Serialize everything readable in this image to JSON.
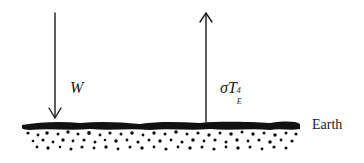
{
  "diagram": {
    "title": "",
    "arrows": [
      {
        "id": "incoming",
        "direction": "down",
        "label": "W"
      },
      {
        "id": "outgoing",
        "direction": "up",
        "label_base": "σT",
        "label_subscript": "E",
        "label_superscript": "4"
      }
    ],
    "surface": {
      "label": "Earth"
    },
    "colors": {
      "ink": "#1a1a1a",
      "background": "#ffffff"
    }
  }
}
